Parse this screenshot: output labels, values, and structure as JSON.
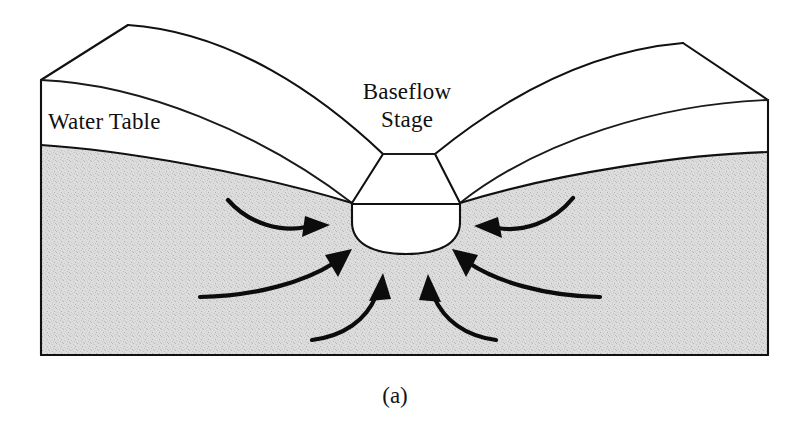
{
  "figure": {
    "caption": "(a)",
    "title_concept": "Baseflow Stage Groundwater Cross-Section"
  },
  "labels": {
    "water_table": "Water Table",
    "baseflow_line1": "Baseflow",
    "baseflow_line2": "Stage"
  },
  "colors": {
    "stroke": "#111111",
    "saturated_zone": "#d8d8d8",
    "unsaturated_zone": "#ffffff",
    "background": "#ffffff",
    "arrow": "#0c0c0c"
  },
  "regions": {
    "unsaturated_zone_name": "unsaturated-zone",
    "saturated_zone_name": "saturated-zone",
    "channel_name": "stream-channel",
    "stream_water_name": "stream-water-body"
  },
  "arrows": {
    "count": 6,
    "description": "groundwater flow converging toward stream channel",
    "items": [
      {
        "name": "flow-arrow-upper-left",
        "direction": "right"
      },
      {
        "name": "flow-arrow-mid-left",
        "direction": "up-right"
      },
      {
        "name": "flow-arrow-lower-left",
        "direction": "up-right"
      },
      {
        "name": "flow-arrow-upper-right",
        "direction": "left"
      },
      {
        "name": "flow-arrow-mid-right",
        "direction": "up-left"
      },
      {
        "name": "flow-arrow-lower-right",
        "direction": "up-left"
      }
    ]
  }
}
